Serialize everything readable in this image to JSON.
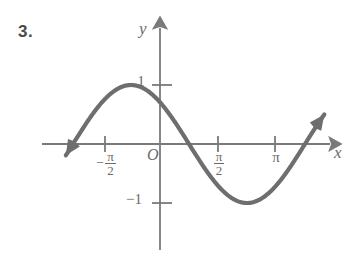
{
  "figure": {
    "problem_number": "3.",
    "axis_labels": {
      "x": "x",
      "y": "y",
      "origin": "O"
    },
    "colors": {
      "curve": "#6e6e6e",
      "axis": "#7a7a7a",
      "text": "#6b6b6b",
      "number": "#4a4a4a",
      "background": "#ffffff"
    }
  },
  "ticks": {
    "x": [
      {
        "label_minus": "−",
        "label_num": "π",
        "label_den": "2",
        "value": -1.5707963,
        "px": 105
      },
      {
        "label_minus": "",
        "label_num": "π",
        "label_den": "2",
        "value": 1.5707963,
        "px": 218
      },
      {
        "label": "π",
        "value": 3.1415927,
        "px": 275
      }
    ],
    "y": [
      {
        "label": "1",
        "value": 1,
        "px": 85
      },
      {
        "label": "−1",
        "value": -1,
        "px": 203
      }
    ]
  },
  "chart_data": {
    "type": "line",
    "title": "",
    "xlabel": "x",
    "ylabel": "y",
    "xlim": [
      -2.55,
      4.45
    ],
    "ylim": [
      -1.62,
      1.62
    ],
    "grid": false,
    "legend": false,
    "function": "y = cos(x + π/4)",
    "xtick_values": [
      -1.5707963,
      1.5707963,
      3.1415927
    ],
    "xtick_labels": [
      "−π/2",
      "π/2",
      "π"
    ],
    "ytick_values": [
      1,
      -1
    ],
    "ytick_labels": [
      "1",
      "−1"
    ],
    "annotations": [
      {
        "text": "curve passes through (0, 1)",
        "x": 0,
        "y": 1
      },
      {
        "text": "arrowhead at left end of curve",
        "x": -2.45,
        "y": -0.65
      },
      {
        "text": "arrowhead at right end of curve",
        "x": 4.3,
        "y": -0.62
      }
    ],
    "series": [
      {
        "name": "y = cos(x + π/4)",
        "x": [
          -2.45,
          -2.3,
          -2.15,
          -2.0,
          -1.85,
          -1.7,
          -1.55,
          -1.4,
          -1.25,
          -1.1,
          -0.95,
          -0.8,
          -0.65,
          -0.5,
          -0.35,
          -0.2,
          -0.05,
          0.0,
          0.1,
          0.25,
          0.4,
          0.55,
          0.7,
          0.85,
          1.0,
          1.15,
          1.3,
          1.45,
          1.6,
          1.75,
          1.9,
          2.05,
          2.2,
          2.35,
          2.5,
          2.65,
          2.8,
          2.95,
          3.1,
          3.25,
          3.4,
          3.55,
          3.7,
          3.85,
          4.0,
          4.15,
          4.3
        ],
        "y": [
          -0.7,
          -0.83,
          -0.93,
          -0.99,
          -1.0,
          -0.97,
          -0.9,
          -0.79,
          -0.64,
          -0.47,
          -0.28,
          -0.08,
          0.12,
          0.32,
          0.5,
          0.66,
          0.79,
          0.71,
          0.77,
          0.88,
          0.96,
          1.0,
          0.99,
          0.94,
          0.85,
          0.72,
          0.56,
          0.38,
          0.19,
          -0.01,
          -0.21,
          -0.4,
          -0.57,
          -0.72,
          -0.84,
          -0.93,
          -0.99,
          -1.0,
          -0.98,
          -0.92,
          -0.82,
          -0.69,
          -0.53,
          -0.35,
          -0.16,
          0.04,
          0.24
        ]
      }
    ]
  }
}
